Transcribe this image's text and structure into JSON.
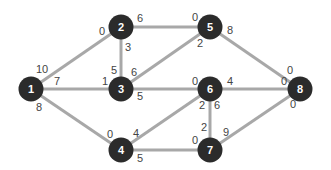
{
  "colors": {
    "edge": "#a8a8a8",
    "node": "#2b2b2b",
    "node_text": "#ffffff",
    "label": "#444444"
  },
  "nodes": [
    {
      "id": "1",
      "x": 31,
      "y": 89
    },
    {
      "id": "2",
      "x": 121,
      "y": 27
    },
    {
      "id": "3",
      "x": 121,
      "y": 89
    },
    {
      "id": "4",
      "x": 121,
      "y": 150
    },
    {
      "id": "5",
      "x": 210,
      "y": 27
    },
    {
      "id": "6",
      "x": 210,
      "y": 89
    },
    {
      "id": "7",
      "x": 210,
      "y": 150
    },
    {
      "id": "8",
      "x": 300,
      "y": 89
    }
  ],
  "edges": [
    {
      "from": "1",
      "to": "2"
    },
    {
      "from": "1",
      "to": "3"
    },
    {
      "from": "1",
      "to": "4"
    },
    {
      "from": "2",
      "to": "3"
    },
    {
      "from": "2",
      "to": "5"
    },
    {
      "from": "3",
      "to": "5"
    },
    {
      "from": "3",
      "to": "6"
    },
    {
      "from": "4",
      "to": "6"
    },
    {
      "from": "4",
      "to": "7"
    },
    {
      "from": "5",
      "to": "8"
    },
    {
      "from": "6",
      "to": "7"
    },
    {
      "from": "6",
      "to": "8"
    },
    {
      "from": "7",
      "to": "8"
    }
  ],
  "labels": [
    {
      "text": "10",
      "x": 36,
      "y": 73
    },
    {
      "text": "7",
      "x": 54,
      "y": 85
    },
    {
      "text": "8",
      "x": 36,
      "y": 111
    },
    {
      "text": "0",
      "x": 99,
      "y": 35
    },
    {
      "text": "6",
      "x": 137,
      "y": 22
    },
    {
      "text": "3",
      "x": 125,
      "y": 51
    },
    {
      "text": "5",
      "x": 111,
      "y": 74
    },
    {
      "text": "1",
      "x": 102,
      "y": 85
    },
    {
      "text": "6",
      "x": 131,
      "y": 76
    },
    {
      "text": "5",
      "x": 137,
      "y": 100
    },
    {
      "text": "0",
      "x": 107,
      "y": 138
    },
    {
      "text": "4",
      "x": 133,
      "y": 137
    },
    {
      "text": "5",
      "x": 137,
      "y": 162
    },
    {
      "text": "0",
      "x": 192,
      "y": 21
    },
    {
      "text": "8",
      "x": 227,
      "y": 34
    },
    {
      "text": "2",
      "x": 197,
      "y": 47
    },
    {
      "text": "0",
      "x": 192,
      "y": 85
    },
    {
      "text": "4",
      "x": 227,
      "y": 85
    },
    {
      "text": "2",
      "x": 199,
      "y": 109
    },
    {
      "text": "6",
      "x": 214,
      "y": 109
    },
    {
      "text": "2",
      "x": 201,
      "y": 131
    },
    {
      "text": "0",
      "x": 192,
      "y": 144
    },
    {
      "text": "9",
      "x": 223,
      "y": 136
    },
    {
      "text": "0",
      "x": 281,
      "y": 85
    },
    {
      "text": "0",
      "x": 287,
      "y": 74
    },
    {
      "text": "0",
      "x": 290,
      "y": 108
    }
  ]
}
